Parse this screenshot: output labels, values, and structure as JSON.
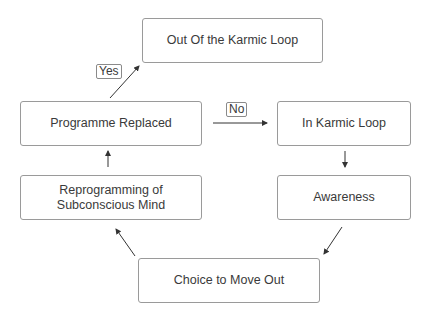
{
  "nodes": {
    "out_of_loop": "Out Of the Karmic Loop",
    "programme_replaced": "Programme Replaced",
    "in_karmic_loop": "In Karmic Loop",
    "reprogramming_line1": "Reprogramming of",
    "reprogramming_line2": "Subconscious Mind",
    "awareness": "Awareness",
    "choice": "Choice to Move Out"
  },
  "edge_labels": {
    "yes": "Yes",
    "no": "No"
  },
  "edges": [
    {
      "from": "programme_replaced",
      "to": "out_of_loop",
      "label": "yes"
    },
    {
      "from": "programme_replaced",
      "to": "in_karmic_loop",
      "label": "no"
    },
    {
      "from": "in_karmic_loop",
      "to": "awareness"
    },
    {
      "from": "awareness",
      "to": "choice"
    },
    {
      "from": "choice",
      "to": "reprogramming"
    },
    {
      "from": "reprogramming",
      "to": "programme_replaced"
    }
  ],
  "colors": {
    "border": "#9a9a9a",
    "arrow": "#333333",
    "background": "#ffffff"
  }
}
